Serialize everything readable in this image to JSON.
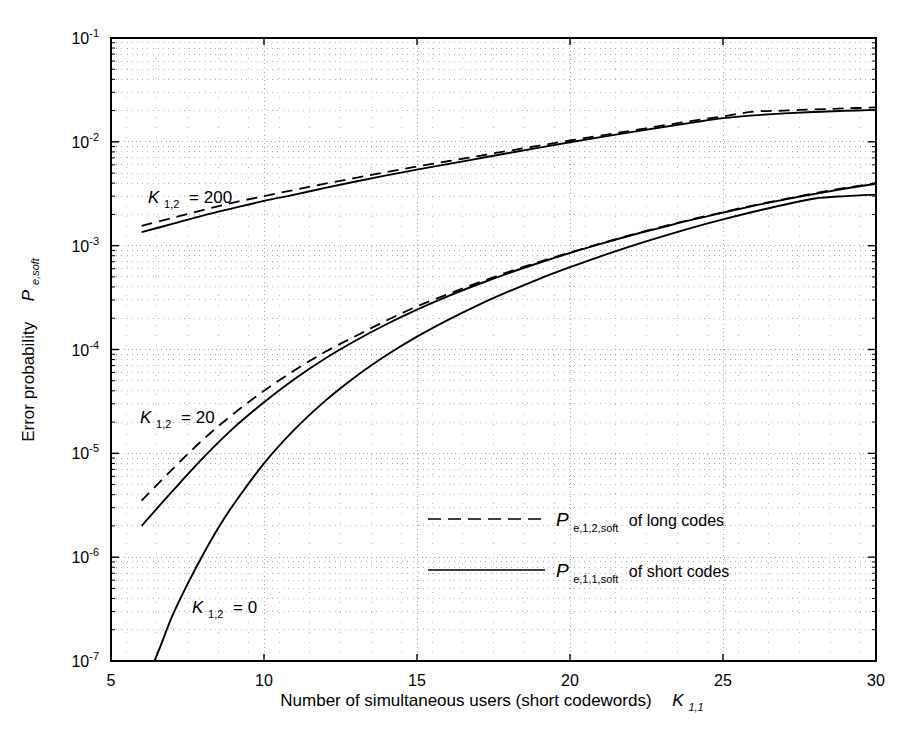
{
  "figure": {
    "background": "#ffffff",
    "foreground": "#000000",
    "grid_color": "#9a9a9a"
  },
  "axes": {
    "x_label_main": "Number of simultaneous users  (short codewords)",
    "x_label_symbol": "K",
    "x_label_symbol_sub": "1,1",
    "y_label_main": "Error probability",
    "y_label_symbol": "P",
    "y_label_symbol_sub": "e,soft",
    "x_ticks": [
      "5",
      "10",
      "15",
      "20",
      "25",
      "30"
    ],
    "y_ticks": [
      "10",
      "10",
      "10",
      "10",
      "10",
      "10",
      "10"
    ],
    "y_tick_exponents": [
      "-1",
      "-2",
      "-3",
      "-4",
      "-5",
      "-6",
      "-7"
    ]
  },
  "annotations": [
    {
      "id": "k200",
      "symbol": "K",
      "sub": "1,2",
      "eq": "= 200"
    },
    {
      "id": "k20",
      "symbol": "K",
      "sub": "1,2",
      "eq": "= 20"
    },
    {
      "id": "k0",
      "symbol": "K",
      "sub": "1,2",
      "eq": "= 0"
    }
  ],
  "legend": {
    "entries": [
      {
        "style": "dashed",
        "symbol": "P",
        "sub": "e,1,2,soft",
        "text": "of long codes"
      },
      {
        "style": "solid",
        "symbol": "P",
        "sub": "e,1,1,soft",
        "text": "of short codes"
      }
    ]
  },
  "chart_data": {
    "type": "line",
    "title": "",
    "xlabel": "Number of simultaneous users (short codewords) K_1,1",
    "ylabel": "Error probability P_e,soft",
    "xscale": "linear",
    "yscale": "log",
    "xlim": [
      5,
      30
    ],
    "ylim": [
      1e-07,
      0.1
    ],
    "grid": true,
    "grid_style": "dotted",
    "legend_position": "center-right-inside",
    "series": [
      {
        "name": "K_1,2 = 200, P_e,1,2,soft of long codes",
        "group": "K_1,2 = 200",
        "style": "dashed",
        "x": [
          6,
          7,
          8,
          9,
          10,
          11,
          12,
          13,
          14,
          15,
          16,
          17,
          18,
          19,
          20,
          21,
          22,
          23,
          24,
          25,
          26,
          27,
          28,
          29,
          30
        ],
        "y": [
          0.00155,
          0.00185,
          0.0022,
          0.0026,
          0.003,
          0.00345,
          0.00395,
          0.0045,
          0.0051,
          0.0058,
          0.0065,
          0.0073,
          0.0082,
          0.0092,
          0.0103,
          0.0115,
          0.0128,
          0.0143,
          0.0159,
          0.0176,
          0.0195,
          0.02,
          0.0205,
          0.021,
          0.0215
        ]
      },
      {
        "name": "K_1,2 = 200, P_e,1,1,soft of short codes",
        "group": "K_1,2 = 200",
        "style": "solid",
        "x": [
          6,
          7,
          8,
          9,
          10,
          11,
          12,
          13,
          14,
          15,
          16,
          17,
          18,
          19,
          20,
          21,
          22,
          23,
          24,
          25,
          26,
          27,
          28,
          29,
          30
        ],
        "y": [
          0.00135,
          0.00162,
          0.00195,
          0.0023,
          0.0027,
          0.0031,
          0.0036,
          0.00415,
          0.00475,
          0.0054,
          0.0061,
          0.0069,
          0.0078,
          0.0088,
          0.0099,
          0.0111,
          0.0124,
          0.0138,
          0.0153,
          0.0169,
          0.018,
          0.0188,
          0.0194,
          0.0199,
          0.0203
        ]
      },
      {
        "name": "K_1,2 = 20, P_e,1,2,soft of long codes",
        "group": "K_1,2 = 20",
        "style": "dashed",
        "x": [
          6,
          7,
          8,
          9,
          10,
          11,
          12,
          13,
          14,
          15,
          16,
          17,
          18,
          19,
          20,
          21,
          22,
          23,
          24,
          25,
          26,
          27,
          28,
          29,
          30
        ],
        "y": [
          3.5e-06,
          7e-06,
          1.35e-05,
          2.4e-05,
          4e-05,
          6.3e-05,
          9.5e-05,
          0.000135,
          0.00019,
          0.00026,
          0.00034,
          0.00044,
          0.00056,
          0.0007,
          0.00086,
          0.00105,
          0.00127,
          0.00152,
          0.0018,
          0.0021,
          0.00245,
          0.0028,
          0.0032,
          0.0036,
          0.004
        ]
      },
      {
        "name": "K_1,2 = 20, P_e,1,1,soft of short codes",
        "group": "K_1,2 = 20",
        "style": "solid",
        "x": [
          6,
          7,
          8,
          9,
          10,
          11,
          12,
          13,
          14,
          15,
          16,
          17,
          18,
          19,
          20,
          21,
          22,
          23,
          24,
          25,
          26,
          27,
          28,
          29,
          30
        ],
        "y": [
          2e-06,
          4.3e-06,
          9e-06,
          1.75e-05,
          3.1e-05,
          5.2e-05,
          8.2e-05,
          0.000122,
          0.000175,
          0.000242,
          0.000325,
          0.000425,
          0.000545,
          0.000685,
          0.00085,
          0.00104,
          0.00126,
          0.0015,
          0.00178,
          0.00208,
          0.00242,
          0.00278,
          0.00315,
          0.00355,
          0.00395
        ]
      },
      {
        "name": "K_1,2 = 0, P_e,1,1,soft of short codes",
        "group": "K_1,2 = 0",
        "style": "solid",
        "x": [
          6.42,
          6.6,
          7,
          7.5,
          8,
          8.5,
          9,
          10,
          11,
          12,
          13,
          14,
          15,
          16,
          17,
          18,
          19,
          20,
          21,
          22,
          23,
          24,
          25,
          26,
          27,
          28,
          29,
          30
        ],
        "y": [
          1e-07,
          1.35e-07,
          2.7e-07,
          5.5e-07,
          1.05e-06,
          1.9e-06,
          3.2e-06,
          8e-06,
          1.7e-05,
          3.2e-05,
          5.5e-05,
          8.8e-05,
          0.000133,
          0.000192,
          0.000268,
          0.000362,
          0.00048,
          0.00062,
          0.00079,
          0.00099,
          0.00122,
          0.00149,
          0.00179,
          0.00212,
          0.00248,
          0.00285,
          0.003,
          0.0031
        ]
      }
    ]
  }
}
